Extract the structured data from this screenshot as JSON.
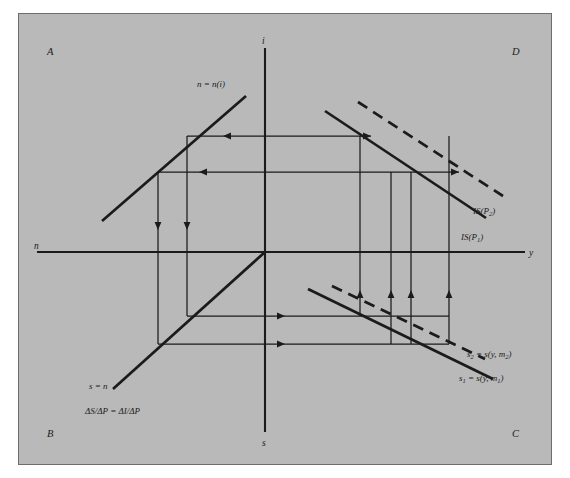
{
  "figure": {
    "kind": "four-quadrant-is-curve-derivation",
    "background_color": "#b9b9b9",
    "page_color": "#ffffff",
    "border_color": "#6d6d6d",
    "ink_color": "#1b1b1b"
  },
  "quadrants": {
    "top_left": "A",
    "bottom_left": "B",
    "bottom_right": "C",
    "top_right": "D"
  },
  "axes": {
    "vertical_top": "i",
    "vertical_bottom": "s",
    "horizontal_left": "n",
    "horizontal_right": "y"
  },
  "curves": {
    "investment": "n = n(i)",
    "forty_five": "s = n",
    "identity": "ΔS/ΔP = ΔI/ΔP",
    "saving_1": {
      "lhs": "s",
      "lhs_sub": "1",
      "rhs_a": " = s(y, m",
      "rhs_sub": "1",
      "rhs_b": ")"
    },
    "saving_2": {
      "lhs": "s",
      "lhs_sub": "2",
      "rhs_a": " = s(y, m",
      "rhs_sub": "2",
      "rhs_b": ")"
    },
    "is_1": {
      "lhs": "IS(P",
      "sub": "1",
      "rhs": ")"
    },
    "is_2": {
      "lhs": "IS(P",
      "sub": "2",
      "rhs": ")"
    }
  }
}
